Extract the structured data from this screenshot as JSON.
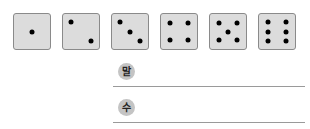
{
  "dice": [
    {
      "value": 1,
      "left": 13,
      "pips": [
        [
          50,
          50
        ]
      ]
    },
    {
      "value": 2,
      "left": 62,
      "pips": [
        [
          22,
          22
        ],
        [
          78,
          78
        ]
      ]
    },
    {
      "value": 3,
      "left": 111,
      "pips": [
        [
          22,
          22
        ],
        [
          50,
          50
        ],
        [
          78,
          78
        ]
      ]
    },
    {
      "value": 4,
      "left": 160,
      "pips": [
        [
          25,
          25
        ],
        [
          75,
          25
        ],
        [
          25,
          75
        ],
        [
          75,
          75
        ]
      ]
    },
    {
      "value": 5,
      "left": 209,
      "pips": [
        [
          25,
          25
        ],
        [
          75,
          25
        ],
        [
          50,
          50
        ],
        [
          25,
          75
        ],
        [
          75,
          75
        ]
      ]
    },
    {
      "value": 6,
      "left": 258,
      "pips": [
        [
          25,
          22
        ],
        [
          75,
          22
        ],
        [
          25,
          50
        ],
        [
          75,
          50
        ],
        [
          25,
          78
        ],
        [
          75,
          78
        ]
      ]
    }
  ],
  "answers": [
    {
      "label": "말",
      "top": 63,
      "value": ""
    },
    {
      "label": "수",
      "top": 99,
      "value": ""
    }
  ],
  "colors": {
    "die_face": "#dcdcdc",
    "die_border": "#8a8a8a",
    "pip": "#000000",
    "label_circle": "#c4c4c4",
    "line": "#9a9a9a"
  }
}
